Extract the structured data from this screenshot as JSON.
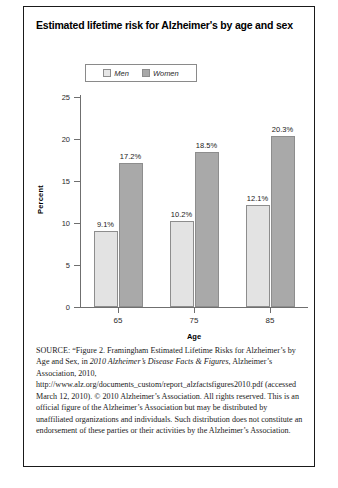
{
  "figure": {
    "title": "Estimated lifetime risk for Alzheimer's by age and sex",
    "source_prefix": "SOURCE:",
    "source_text": " “Figure 2. Framingham Estimated Lifetime Risks for Alzheimer’s by Age and Sex, in ",
    "source_italic_1": "2010 Alzheimer’s Disease Facts & Figures",
    "source_text_2": ", Alzheimer’s Association, 2010, http://www.alz.org/documents_custom/report_alzfactsfigures2010.pdf (accessed March 12, 2010). © 2010 Alzheimer’s Association. All rights reserved. This is an official figure of the Alzheimer’s Association but may be distributed by unaffiliated organizations and individuals. Such distribution does not constitute an endorsement of these parties or their activities by the Alzheimer’s Association."
  },
  "chart_data": {
    "type": "bar",
    "title": "Estimated lifetime risk for Alzheimer's by age and sex",
    "categories": [
      "65",
      "75",
      "85"
    ],
    "series": [
      {
        "name": "Men",
        "values": [
          9.1,
          10.2,
          12.1
        ],
        "labels": [
          "9.1%",
          "10.2%",
          "12.1%"
        ],
        "color": "#e3e3e3"
      },
      {
        "name": "Women",
        "values": [
          17.2,
          18.5,
          20.3
        ],
        "labels": [
          "17.2%",
          "18.5%",
          "20.3%"
        ],
        "color": "#a9a9a9"
      }
    ],
    "xlabel": "Age",
    "ylabel": "Percent",
    "ylim": [
      0,
      25
    ],
    "yticks": [
      0,
      5,
      10,
      15,
      20,
      25
    ],
    "ytick_labels": [
      "0",
      "5",
      "10",
      "15",
      "20",
      "25"
    ],
    "grid": false,
    "legend_position": "top-center",
    "legend_entries": [
      "Men",
      "Women"
    ]
  }
}
